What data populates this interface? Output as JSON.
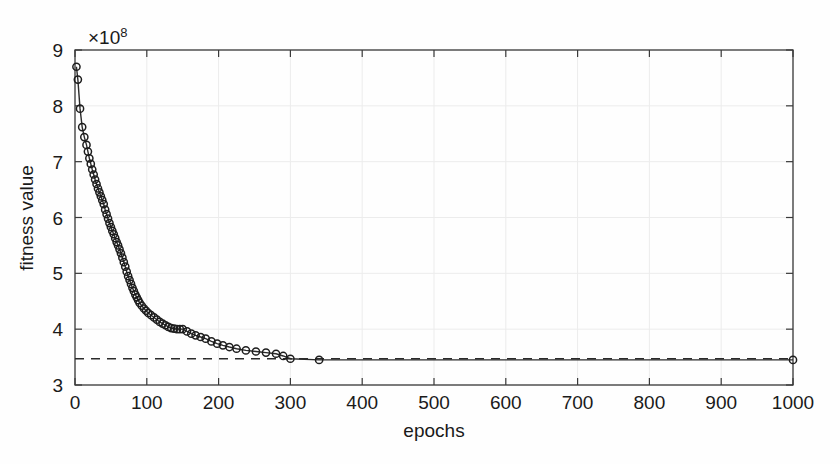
{
  "chart_data": {
    "type": "line",
    "title": "",
    "subtitle": "",
    "xlabel": "epochs",
    "ylabel": "fitness value",
    "y_exponent_label": "×10",
    "y_exponent_power": "8",
    "y_scale_factor": 100000000,
    "xlim": [
      0,
      1000
    ],
    "ylim": [
      3,
      9
    ],
    "xticks": [
      0,
      100,
      200,
      300,
      400,
      500,
      600,
      700,
      800,
      900,
      1000
    ],
    "xticklabels": [
      "0",
      "100",
      "200",
      "300",
      "400",
      "500",
      "600",
      "700",
      "800",
      "900",
      "1000"
    ],
    "yticks": [
      3,
      4,
      5,
      6,
      7,
      8,
      9
    ],
    "yticklabels": [
      "3",
      "4",
      "5",
      "6",
      "7",
      "8",
      "9"
    ],
    "grid": true,
    "legend": "none",
    "line_color": "#2b2b2b",
    "marker": "circle-open",
    "marker_color": "#1d1d1d",
    "series": [
      {
        "name": "fitness value",
        "marker": "o",
        "x": [
          2,
          4,
          7,
          10,
          13,
          16,
          18,
          20,
          22,
          24,
          26,
          28,
          30,
          32,
          34,
          36,
          38,
          40,
          42,
          44,
          46,
          48,
          50,
          52,
          54,
          56,
          58,
          60,
          62,
          64,
          66,
          68,
          70,
          72,
          74,
          76,
          78,
          80,
          82,
          84,
          86,
          88,
          90,
          93,
          96,
          99,
          102,
          106,
          110,
          114,
          118,
          122,
          126,
          130,
          134,
          138,
          142,
          146,
          150,
          156,
          162,
          168,
          175,
          182,
          190,
          198,
          206,
          215,
          225,
          238,
          252,
          266,
          280,
          290,
          300,
          340,
          1000
        ],
        "y": [
          8.7,
          8.47,
          7.95,
          7.62,
          7.44,
          7.3,
          7.18,
          7.06,
          6.96,
          6.86,
          6.77,
          6.68,
          6.6,
          6.52,
          6.45,
          6.38,
          6.31,
          6.24,
          6.14,
          6.06,
          5.98,
          5.9,
          5.83,
          5.76,
          5.7,
          5.63,
          5.56,
          5.5,
          5.43,
          5.36,
          5.28,
          5.2,
          5.12,
          5.03,
          4.95,
          4.88,
          4.81,
          4.74,
          4.68,
          4.62,
          4.57,
          4.52,
          4.47,
          4.42,
          4.37,
          4.33,
          4.29,
          4.25,
          4.21,
          4.17,
          4.13,
          4.1,
          4.07,
          4.04,
          4.02,
          4.01,
          4.0,
          4.0,
          4.0,
          3.96,
          3.92,
          3.89,
          3.86,
          3.83,
          3.78,
          3.74,
          3.71,
          3.68,
          3.65,
          3.62,
          3.6,
          3.58,
          3.56,
          3.52,
          3.47,
          3.45,
          3.45
        ],
        "units": "×10^8"
      }
    ],
    "reference_line": {
      "name": "optimum-reference",
      "style": "dashed",
      "orientation": "horizontal",
      "y": 3.47,
      "x_start": 0,
      "x_end": 1000,
      "color": "#2b2b2b"
    },
    "annotations": [],
    "notes_visible": []
  },
  "figure": {
    "background_color": "#fefefe",
    "axes_color": "#3a3a3a",
    "grid_color": "#ececec"
  }
}
